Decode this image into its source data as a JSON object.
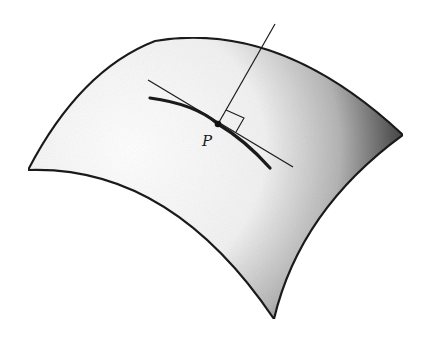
{
  "figure": {
    "point_label": "P",
    "elements": [
      "surface-patch",
      "curve-on-surface",
      "tangent-line",
      "normal-line",
      "right-angle-marker",
      "point-p"
    ],
    "colors": {
      "stroke": "#1a1a1a",
      "surface_light": "#ffffff",
      "surface_dark": "#3a3a3a"
    }
  }
}
